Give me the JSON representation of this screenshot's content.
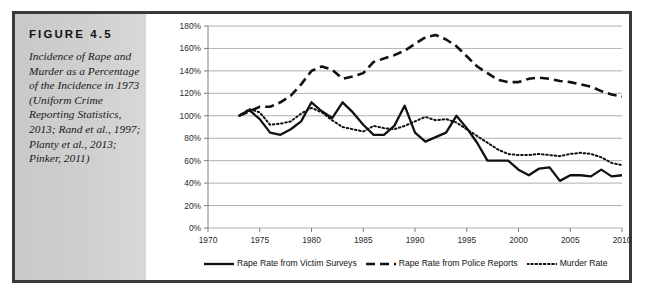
{
  "figure": {
    "label": "FIGURE  4.5",
    "caption": "Incidence of Rape and Murder as a Percentage of the Incidence in 1973 (Uniform Crime Reporting Statistics, 2013; Rand et al., 1997; Planty et al., 2013; Pinker, 2011)"
  },
  "colors": {
    "border": "#3a3a3a",
    "sidebar": "#cfcfcf",
    "gridline": "#a8a8a8",
    "axis": "#808080",
    "series": "#111111"
  },
  "chart_data": {
    "type": "line",
    "title": "",
    "xlabel": "",
    "ylabel": "",
    "xlim": [
      1970,
      2010
    ],
    "ylim": [
      0,
      180
    ],
    "grid": true,
    "legend_position": "bottom",
    "xticks": [
      1970,
      1975,
      1980,
      1985,
      1990,
      1995,
      2000,
      2005,
      2010
    ],
    "xtick_labels": [
      "1970",
      "1975",
      "1980",
      "1985",
      "1990",
      "1995",
      "2000",
      "2005",
      "2010"
    ],
    "yticks": [
      0,
      20,
      40,
      60,
      80,
      100,
      120,
      140,
      160,
      180
    ],
    "ytick_labels": [
      "0%",
      "20%",
      "40%",
      "60%",
      "80%",
      "100%",
      "120%",
      "140%",
      "160%",
      "180%"
    ],
    "x": [
      1973,
      1974,
      1975,
      1976,
      1977,
      1978,
      1979,
      1980,
      1981,
      1982,
      1983,
      1984,
      1985,
      1986,
      1987,
      1988,
      1989,
      1990,
      1991,
      1992,
      1993,
      1994,
      1995,
      1996,
      1997,
      1998,
      1999,
      2000,
      2001,
      2002,
      2003,
      2004,
      2005,
      2006,
      2007,
      2008,
      2009,
      2010
    ],
    "series": [
      {
        "name": "Rape Rate from Victim Surveys",
        "style": "solid",
        "values": [
          100,
          105,
          97,
          85,
          83,
          88,
          95,
          112,
          104,
          98,
          112,
          103,
          92,
          83,
          83,
          91,
          109,
          85,
          77,
          81,
          85,
          100,
          89,
          76,
          60,
          60,
          60,
          52,
          47,
          53,
          54,
          42,
          47,
          47,
          46,
          52,
          46,
          47
        ]
      },
      {
        "name": "Rape Rate from Police Reports",
        "style": "dashed",
        "values": [
          100,
          104,
          108,
          108,
          112,
          118,
          128,
          140,
          144,
          141,
          133,
          135,
          138,
          148,
          151,
          154,
          158,
          164,
          170,
          172,
          168,
          162,
          153,
          144,
          138,
          132,
          130,
          130,
          133,
          134,
          133,
          131,
          130,
          128,
          126,
          122,
          119,
          117
        ]
      },
      {
        "name": "Murder Rate",
        "style": "dotted",
        "values": [
          100,
          106,
          103,
          92,
          93,
          95,
          102,
          107,
          103,
          96,
          90,
          88,
          86,
          91,
          89,
          88,
          91,
          95,
          99,
          96,
          97,
          94,
          88,
          82,
          76,
          70,
          66,
          65,
          65,
          66,
          65,
          64,
          66,
          67,
          66,
          63,
          58,
          56
        ]
      }
    ]
  },
  "legend": {
    "items": [
      {
        "label": "Rape Rate from Victim Surveys",
        "style": "solid"
      },
      {
        "label": "Rape Rate from Police Reports",
        "style": "dashed"
      },
      {
        "label": "Murder Rate",
        "style": "dotted"
      }
    ]
  }
}
